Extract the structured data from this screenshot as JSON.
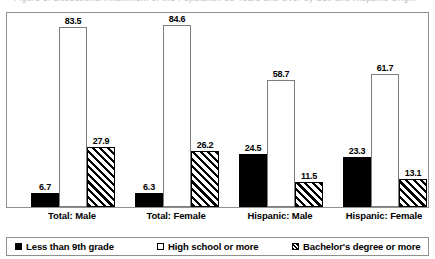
{
  "title_strip": {
    "text": "Figure 1. Educational Attainment of the Population 25 Years and Over by Sex and Hispanic Origin"
  },
  "chart_data": {
    "type": "bar",
    "title": "",
    "xlabel": "",
    "ylabel": "",
    "ylim": [
      0,
      90
    ],
    "grid": false,
    "legend_position": "bottom",
    "categories": [
      "Total: Male",
      "Total: Female",
      "Hispanic: Male",
      "Hispanic: Female"
    ],
    "series": [
      {
        "name": "Less than 9th grade",
        "fill": "solid-black",
        "color": "#000000",
        "values": [
          6.7,
          6.3,
          24.5,
          23.3
        ]
      },
      {
        "name": "High school or more",
        "fill": "white-outline",
        "color": "#ffffff",
        "values": [
          83.5,
          84.6,
          58.7,
          61.7
        ]
      },
      {
        "name": "Bachelor's degree or more",
        "fill": "diagonal-hatch",
        "color": "#000000",
        "values": [
          27.9,
          26.2,
          11.5,
          13.1
        ]
      }
    ],
    "data_labels": [
      [
        "6.7",
        "83.5",
        "27.9"
      ],
      [
        "6.3",
        "84.6",
        "26.2"
      ],
      [
        "24.5",
        "58.7",
        "11.5"
      ],
      [
        "23.3",
        "61.7",
        "13.1"
      ]
    ]
  }
}
